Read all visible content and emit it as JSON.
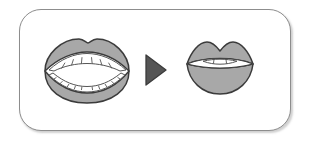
{
  "figure": {
    "type": "instructional-diagram",
    "frame": {
      "shape": "rounded-rectangle",
      "border_color": "#8d8d8d",
      "background_color": "#ffffff",
      "has_drop_shadow": true
    },
    "palette": {
      "lip_fill": "#a8a8a8",
      "lip_outline": "#3b3b3b",
      "teeth_fill": "#ffffff",
      "teeth_outline": "#555555",
      "mouth_interior": "#ffffff",
      "arrow_fill": "#555555",
      "arrow_outline": "#3b3b3b",
      "page_background": "#ffffff"
    },
    "items": [
      {
        "id": "mouth-open-wide",
        "label": "",
        "description": "wide open mouth showing upper and lower teeth",
        "upper_teeth_count": 6,
        "lower_teeth_count": 10,
        "state": "open"
      },
      {
        "id": "transition-arrow",
        "label": "",
        "description": "solid right-pointing triangle arrow",
        "direction": "right"
      },
      {
        "id": "mouth-slightly-open",
        "label": "",
        "description": "slightly open rounded lips showing only upper teeth",
        "upper_teeth_count": 3,
        "lower_teeth_count": 0,
        "state": "slightly-open"
      }
    ]
  }
}
